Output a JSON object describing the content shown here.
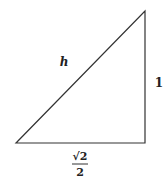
{
  "diagram": {
    "type": "right-triangle",
    "labels": {
      "hypotenuse": "h",
      "vertical_leg": "1",
      "horizontal_leg_numerator": "√2",
      "horizontal_leg_denominator": "2"
    },
    "colors": {
      "stroke": "#333333",
      "text": "#222222",
      "background": "#ffffff"
    }
  }
}
